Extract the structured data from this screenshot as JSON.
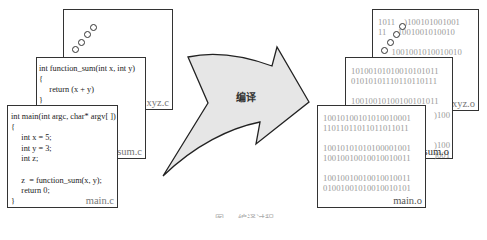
{
  "source_files": {
    "xyz": {
      "name": "xyz.c"
    },
    "sum": {
      "name": "sum.c",
      "code": "int function_sum(int x, int y)\n{\n     return (x + y)\n}"
    },
    "main": {
      "name": "main.c",
      "code": "int main(int argc, char* argv[ ])\n{\n     int x = 5;\n     int y = 3;\n     int z;\n\n     z  = function_sum(x, y);\n     return 0;\n}"
    }
  },
  "arrow": {
    "label": "编译",
    "fill": "#e6e6e6"
  },
  "object_files": {
    "xyz": {
      "name": "xyz.o",
      "lines": [
        "1011   )100101001001",
        "11    ,1001001010010",
        "",
        "  1001001010010010",
        "                )111",
        "",
        "                )100",
        "                )001",
        "",
        "                )100"
      ]
    },
    "sum": {
      "name": "sum.o",
      "lines": [
        "10100101010010101011",
        "01010101110110110111",
        "",
        "10010010100100101011"
      ],
      "extra": [
        "",
        "",
        "",
        "",
        "",
        "",
        "                   )100",
        "                   )001"
      ]
    },
    "main": {
      "name": "main.o",
      "lines": [
        "10010100101010010001",
        "11011011011011011011",
        "",
        "10010101010100001001",
        "10010010010010010011",
        "",
        "10010010010010010011",
        "01001001010010010101"
      ]
    }
  },
  "caption": "图 ... 编译过程"
}
